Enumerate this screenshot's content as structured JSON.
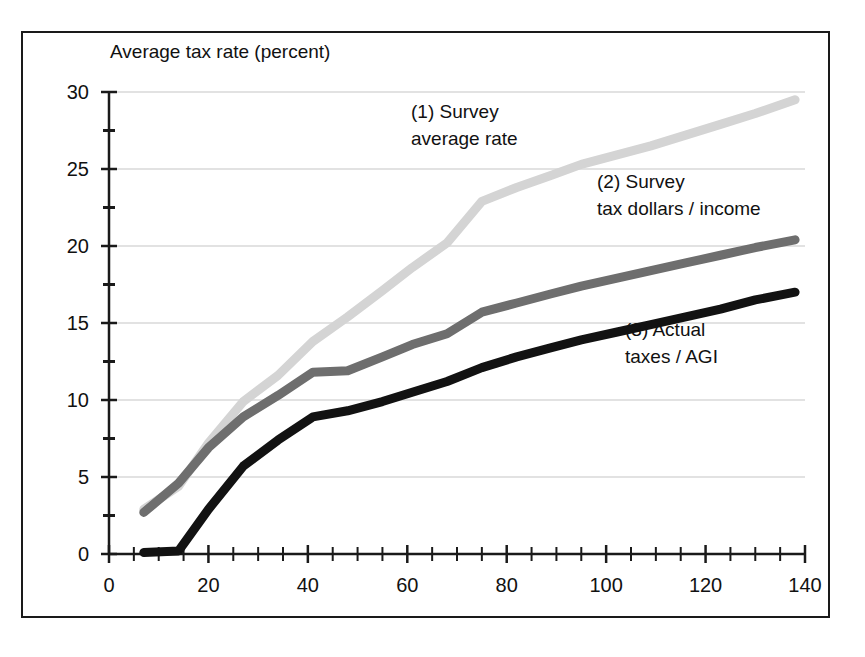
{
  "chart_data": {
    "type": "line",
    "title": "Average tax rate (percent)",
    "xlabel": "Income in thousands of 1996 dollars",
    "ylabel": "Average tax rate (percent)",
    "xlim": [
      0,
      140
    ],
    "ylim": [
      0,
      30
    ],
    "xticks": [
      0,
      20,
      40,
      60,
      80,
      100,
      120,
      140
    ],
    "yticks": [
      0,
      5,
      10,
      15,
      20,
      25,
      30
    ],
    "x_minor_tick_step": 5,
    "y_minor_tick_step": 2.5,
    "grid": "horizontal",
    "grid_color": "#d8d8d8",
    "legend_position": "inline-annotations",
    "background": "#ffffff",
    "series": [
      {
        "name": "(1) Survey average rate",
        "label_line1": "(1) Survey",
        "label_line2": "average rate",
        "color": "#d4d4d4",
        "width": 9,
        "x": [
          7,
          14,
          20,
          27,
          34,
          41,
          48,
          55,
          61,
          68,
          75,
          82,
          89,
          95,
          102,
          109,
          116,
          123,
          130,
          138
        ],
        "y": [
          2.9,
          4.4,
          7.2,
          9.9,
          11.6,
          13.8,
          15.4,
          17.1,
          18.6,
          20.2,
          22.9,
          23.8,
          24.6,
          25.3,
          25.9,
          26.5,
          27.2,
          27.9,
          28.6,
          29.5
        ]
      },
      {
        "name": "(2) Survey tax dollars / income",
        "label_line1": "(2) Survey",
        "label_line2": "tax dollars / income",
        "color": "#6e6e6e",
        "width": 9,
        "x": [
          7,
          14,
          20,
          27,
          34,
          41,
          48,
          55,
          61,
          68,
          75,
          82,
          89,
          95,
          102,
          109,
          116,
          123,
          130,
          138
        ],
        "y": [
          2.7,
          4.6,
          6.9,
          8.9,
          10.3,
          11.8,
          11.9,
          12.8,
          13.6,
          14.3,
          15.7,
          16.3,
          16.9,
          17.4,
          17.9,
          18.4,
          18.9,
          19.4,
          19.9,
          20.4
        ]
      },
      {
        "name": "(3) Actual taxes / AGI",
        "label_line1": "(3) Actual",
        "label_line2": "taxes / AGI",
        "color": "#121212",
        "width": 9,
        "x": [
          7,
          14,
          20,
          27,
          34,
          41,
          48,
          55,
          61,
          68,
          75,
          82,
          89,
          95,
          102,
          109,
          116,
          123,
          130,
          138
        ],
        "y": [
          0.1,
          0.2,
          2.9,
          5.7,
          7.4,
          8.9,
          9.3,
          9.9,
          10.5,
          11.2,
          12.1,
          12.8,
          13.4,
          13.9,
          14.4,
          14.9,
          15.4,
          15.9,
          16.5,
          17.0
        ]
      }
    ],
    "annotations": [
      {
        "series": 0,
        "text_line1": "(1) Survey",
        "text_line2": "average rate",
        "x_px": 411,
        "y_px": 118
      },
      {
        "series": 1,
        "text_line1": "(2) Survey",
        "text_line2": "tax dollars / income",
        "x_px": 597,
        "y_px": 188
      },
      {
        "series": 2,
        "text_line1": "(3) Actual",
        "text_line2": "taxes / AGI",
        "x_px": 625,
        "y_px": 336
      }
    ]
  },
  "axes": {
    "title": "Average tax rate (percent)",
    "title_x_px": 110,
    "title_y_px": 58,
    "x_axis_label": "Income in thousands of 1996 dollars",
    "y_tick_labels": [
      "0",
      "5",
      "10",
      "15",
      "20",
      "25",
      "30"
    ],
    "x_tick_labels": [
      "0",
      "20",
      "40",
      "60",
      "80",
      "100",
      "120",
      "140"
    ],
    "axis_color": "#1a1a1a",
    "frame_color": "#1a1a1a"
  }
}
